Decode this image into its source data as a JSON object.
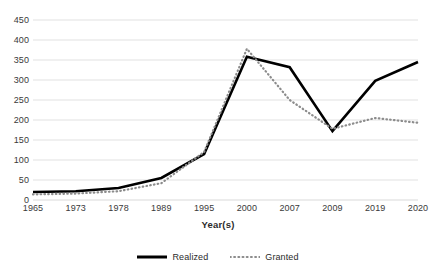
{
  "chart_data": {
    "type": "line",
    "title": "",
    "xlabel": "Year(s)",
    "ylabel": "",
    "categories": [
      "1965",
      "1973",
      "1978",
      "1989",
      "1995",
      "2000",
      "2007",
      "2009",
      "2019",
      "2020"
    ],
    "series": [
      {
        "name": "Realized",
        "style": "solid",
        "color": "#000000",
        "values": [
          20,
          22,
          30,
          55,
          115,
          358,
          332,
          172,
          298,
          345
        ]
      },
      {
        "name": "Granted",
        "style": "dotted",
        "color": "#8c8c8c",
        "values": [
          14,
          16,
          22,
          42,
          120,
          378,
          250,
          178,
          205,
          193
        ]
      }
    ],
    "ylim": [
      0,
      450
    ],
    "ytick_labels": [
      "450",
      "400",
      "350",
      "300",
      "250",
      "200",
      "150",
      "100",
      "50",
      "0"
    ],
    "ytick_values": [
      450,
      400,
      350,
      300,
      250,
      200,
      150,
      100,
      50,
      0
    ],
    "grid": true,
    "grid_color": "#d9d9d9",
    "legend_position": "bottom",
    "legend": [
      "Realized",
      "Granted"
    ]
  }
}
